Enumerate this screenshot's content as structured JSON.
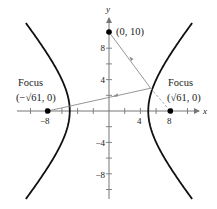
{
  "figure": {
    "type": "hyperbola-reflection-diagram",
    "equation_implied": "x^2/25 - y^2/36 = 1",
    "axes": {
      "x_label": "x",
      "y_label": "y",
      "x_range": [
        -11.5,
        11.5
      ],
      "y_range": [
        -11.5,
        12
      ],
      "tick_step": 2,
      "x_tick_labels": [
        {
          "value": -8,
          "text": "−8"
        },
        {
          "value": 4,
          "text": "4"
        },
        {
          "value": 8,
          "text": "8"
        }
      ],
      "y_tick_labels": [
        {
          "value": 8,
          "text": "8"
        },
        {
          "value": 4,
          "text": "4"
        },
        {
          "value": -4,
          "text": "−4"
        },
        {
          "value": -8,
          "text": "−8"
        }
      ]
    },
    "points": [
      {
        "name": "top-point",
        "label": "(0, 10)",
        "x": 0,
        "y": 10
      },
      {
        "name": "left-focus",
        "title": "Focus",
        "label": "(−√61, 0)",
        "x": -7.81,
        "y": 0
      },
      {
        "name": "right-focus",
        "title": "Focus",
        "label": "(√61, 0)",
        "x": 7.81,
        "y": 0
      }
    ],
    "reflection_point": {
      "x": 5.3,
      "y": 2.9
    },
    "colors": {
      "curve": "#111111",
      "axis": "#777777",
      "ray": "#8a8a8a",
      "point": "#000000"
    }
  }
}
